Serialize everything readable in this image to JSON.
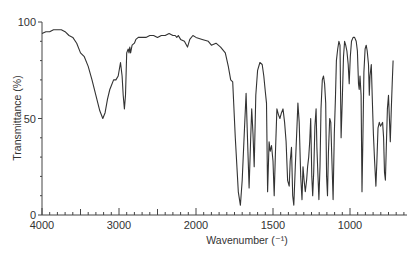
{
  "chart_data": {
    "type": "line",
    "title": "",
    "xlabel": "Wavenumber (⁻¹)",
    "ylabel": "Transmittance (%)",
    "xlim": [
      4000,
      630
    ],
    "ylim": [
      0,
      100
    ],
    "x_axis_scale_break": 2000,
    "grid": false,
    "legend": null,
    "x_ticks": [
      4000,
      3000,
      2000,
      1500,
      1000
    ],
    "y_ticks": [
      0,
      50,
      100
    ],
    "series": [
      {
        "name": "IR spectrum",
        "color": "#333333",
        "points": [
          [
            4000,
            94
          ],
          [
            3950,
            95
          ],
          [
            3900,
            95
          ],
          [
            3850,
            96
          ],
          [
            3800,
            96
          ],
          [
            3750,
            96
          ],
          [
            3700,
            95
          ],
          [
            3650,
            93
          ],
          [
            3600,
            92
          ],
          [
            3550,
            89
          ],
          [
            3500,
            84
          ],
          [
            3450,
            82
          ],
          [
            3400,
            77
          ],
          [
            3350,
            70
          ],
          [
            3300,
            62
          ],
          [
            3250,
            54
          ],
          [
            3210,
            50
          ],
          [
            3180,
            53
          ],
          [
            3150,
            60
          ],
          [
            3120,
            65
          ],
          [
            3100,
            67
          ],
          [
            3070,
            70
          ],
          [
            3040,
            70
          ],
          [
            3010,
            72
          ],
          [
            2980,
            79
          ],
          [
            2960,
            72
          ],
          [
            2945,
            62
          ],
          [
            2930,
            55
          ],
          [
            2915,
            62
          ],
          [
            2900,
            84
          ],
          [
            2880,
            86
          ],
          [
            2870,
            84
          ],
          [
            2860,
            87
          ],
          [
            2850,
            84
          ],
          [
            2830,
            88
          ],
          [
            2800,
            89
          ],
          [
            2780,
            91
          ],
          [
            2750,
            92
          ],
          [
            2700,
            92
          ],
          [
            2650,
            92
          ],
          [
            2600,
            93
          ],
          [
            2550,
            93
          ],
          [
            2500,
            92
          ],
          [
            2450,
            93
          ],
          [
            2400,
            93
          ],
          [
            2350,
            94
          ],
          [
            2300,
            93
          ],
          [
            2270,
            93
          ],
          [
            2250,
            92
          ],
          [
            2230,
            93
          ],
          [
            2200,
            91
          ],
          [
            2150,
            90
          ],
          [
            2110,
            87
          ],
          [
            2080,
            91
          ],
          [
            2040,
            93
          ],
          [
            2000,
            92
          ],
          [
            1960,
            91
          ],
          [
            1920,
            90
          ],
          [
            1900,
            88
          ],
          [
            1870,
            89
          ],
          [
            1840,
            87
          ],
          [
            1810,
            84
          ],
          [
            1790,
            77
          ],
          [
            1775,
            70
          ],
          [
            1762,
            69
          ],
          [
            1745,
            40
          ],
          [
            1725,
            12
          ],
          [
            1712,
            5
          ],
          [
            1700,
            18
          ],
          [
            1685,
            45
          ],
          [
            1675,
            63
          ],
          [
            1665,
            38
          ],
          [
            1655,
            14
          ],
          [
            1645,
            40
          ],
          [
            1638,
            55
          ],
          [
            1630,
            42
          ],
          [
            1622,
            25
          ],
          [
            1612,
            62
          ],
          [
            1600,
            75
          ],
          [
            1585,
            79
          ],
          [
            1570,
            78
          ],
          [
            1560,
            72
          ],
          [
            1550,
            64
          ],
          [
            1542,
            58
          ],
          [
            1535,
            12
          ],
          [
            1525,
            38
          ],
          [
            1518,
            33
          ],
          [
            1510,
            36
          ],
          [
            1500,
            28
          ],
          [
            1492,
            10
          ],
          [
            1485,
            30
          ],
          [
            1475,
            55
          ],
          [
            1465,
            52
          ],
          [
            1455,
            50
          ],
          [
            1445,
            53
          ],
          [
            1435,
            55
          ],
          [
            1425,
            48
          ],
          [
            1415,
            38
          ],
          [
            1405,
            18
          ],
          [
            1395,
            15
          ],
          [
            1388,
            28
          ],
          [
            1380,
            35
          ],
          [
            1372,
            10
          ],
          [
            1365,
            5
          ],
          [
            1355,
            25
          ],
          [
            1345,
            45
          ],
          [
            1338,
            58
          ],
          [
            1330,
            48
          ],
          [
            1320,
            20
          ],
          [
            1312,
            8
          ],
          [
            1305,
            25
          ],
          [
            1298,
            18
          ],
          [
            1290,
            12
          ],
          [
            1282,
            18
          ],
          [
            1275,
            25
          ],
          [
            1268,
            30
          ],
          [
            1262,
            38
          ],
          [
            1255,
            50
          ],
          [
            1248,
            20
          ],
          [
            1242,
            10
          ],
          [
            1236,
            22
          ],
          [
            1228,
            46
          ],
          [
            1220,
            55
          ],
          [
            1215,
            35
          ],
          [
            1208,
            20
          ],
          [
            1202,
            8
          ],
          [
            1195,
            25
          ],
          [
            1188,
            55
          ],
          [
            1180,
            70
          ],
          [
            1172,
            72
          ],
          [
            1165,
            68
          ],
          [
            1158,
            58
          ],
          [
            1152,
            20
          ],
          [
            1146,
            10
          ],
          [
            1140,
            32
          ],
          [
            1132,
            50
          ],
          [
            1125,
            48
          ],
          [
            1118,
            30
          ],
          [
            1110,
            8
          ],
          [
            1102,
            42
          ],
          [
            1095,
            60
          ],
          [
            1088,
            80
          ],
          [
            1080,
            86
          ],
          [
            1072,
            90
          ],
          [
            1065,
            88
          ],
          [
            1058,
            40
          ],
          [
            1050,
            60
          ],
          [
            1042,
            82
          ],
          [
            1035,
            90
          ],
          [
            1028,
            88
          ],
          [
            1020,
            85
          ],
          [
            1012,
            78
          ],
          [
            1005,
            68
          ],
          [
            998,
            82
          ],
          [
            990,
            90
          ],
          [
            980,
            92
          ],
          [
            970,
            92
          ],
          [
            960,
            90
          ],
          [
            952,
            85
          ],
          [
            945,
            68
          ],
          [
            940,
            65
          ],
          [
            935,
            72
          ],
          [
            928,
            62
          ],
          [
            922,
            12
          ],
          [
            916,
            40
          ],
          [
            910,
            74
          ],
          [
            902,
            86
          ],
          [
            895,
            88
          ],
          [
            888,
            85
          ],
          [
            880,
            78
          ],
          [
            875,
            62
          ],
          [
            870,
            72
          ],
          [
            862,
            78
          ],
          [
            855,
            60
          ],
          [
            848,
            42
          ],
          [
            840,
            28
          ],
          [
            832,
            15
          ],
          [
            825,
            28
          ],
          [
            818,
            45
          ],
          [
            810,
            48
          ],
          [
            802,
            46
          ],
          [
            795,
            47
          ],
          [
            788,
            48
          ],
          [
            782,
            40
          ],
          [
            776,
            22
          ],
          [
            770,
            18
          ],
          [
            764,
            35
          ],
          [
            757,
            55
          ],
          [
            750,
            62
          ],
          [
            744,
            50
          ],
          [
            738,
            38
          ],
          [
            732,
            55
          ],
          [
            726,
            68
          ],
          [
            720,
            80
          ]
        ]
      }
    ]
  }
}
